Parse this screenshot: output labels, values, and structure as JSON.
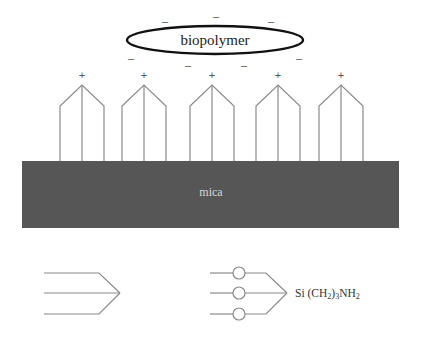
{
  "diagram": {
    "biopolymer": {
      "label": "biopolymer",
      "ellipse": {
        "cx": 215,
        "cy": 40,
        "rx": 88,
        "ry": 14
      },
      "negative_charges": [
        {
          "x": 165,
          "y": 25,
          "sign": "–"
        },
        {
          "x": 216,
          "y": 20,
          "sign": "–"
        },
        {
          "x": 271,
          "y": 25,
          "sign": "–"
        },
        {
          "x": 131,
          "y": 60,
          "sign": "–"
        },
        {
          "x": 299,
          "y": 60,
          "sign": "–"
        },
        {
          "x": 188,
          "y": 67,
          "sign": "–"
        },
        {
          "x": 244,
          "y": 67,
          "sign": "–"
        }
      ]
    },
    "silane_molecules": [
      {
        "apex_x": 82,
        "positive_sign": "+"
      },
      {
        "apex_x": 144,
        "positive_sign": "+"
      },
      {
        "apex_x": 212,
        "positive_sign": "+"
      },
      {
        "apex_x": 278,
        "positive_sign": "+"
      },
      {
        "apex_x": 341,
        "positive_sign": "+"
      }
    ],
    "molecule_geometry": {
      "apex_y": 85,
      "shoulder_y": 106,
      "base_y": 161,
      "half_width": 22,
      "plus_y": 77
    },
    "substrate": {
      "label": "mica",
      "x": 22,
      "y": 161,
      "width": 377,
      "height": 67,
      "color": "#565656"
    },
    "legend": {
      "left_symbol": {
        "line_start_x": 44,
        "line_end_x": 99,
        "tip_x": 120,
        "ys": [
          273,
          293,
          314
        ]
      },
      "right_symbol": {
        "line_start_x": 210,
        "circle_cx": 239,
        "circle_r": 6,
        "line_end_x": 266,
        "tip_x": 287,
        "ys": [
          273,
          293,
          314
        ]
      },
      "formula": {
        "prefix": "Si (CH",
        "sub1": "2",
        "mid": ")",
        "sub2": "3",
        "suffix": "NH",
        "sub3": "2"
      }
    },
    "colors": {
      "line": "#8a8a8a",
      "ellipse_stroke": "#111111",
      "substrate": "#565656",
      "substrate_text": "#d8d8d8"
    }
  }
}
